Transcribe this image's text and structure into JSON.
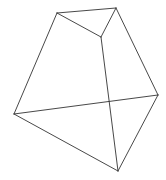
{
  "diagram": {
    "type": "polyhedron-wireframe",
    "stroke_color": "#333333",
    "background": "#ffffff",
    "vertices": {
      "A": [
        57,
        13
      ],
      "B": [
        116,
        8
      ],
      "C": [
        101,
        37
      ],
      "D": [
        14,
        114
      ],
      "E": [
        158,
        95
      ],
      "F": [
        118,
        171
      ]
    },
    "edges": [
      [
        "A",
        "B"
      ],
      [
        "A",
        "C"
      ],
      [
        "B",
        "C"
      ],
      [
        "A",
        "D"
      ],
      [
        "B",
        "E"
      ],
      [
        "C",
        "F"
      ],
      [
        "D",
        "E"
      ],
      [
        "D",
        "F"
      ],
      [
        "E",
        "F"
      ]
    ]
  }
}
